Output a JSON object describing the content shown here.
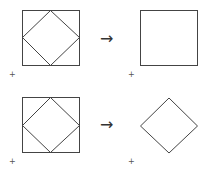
{
  "diagram": {
    "rows": [
      {
        "left": {
          "shape": "square-with-inscribed-diamond",
          "marker": "+"
        },
        "arrow": "→",
        "right": {
          "shape": "square",
          "marker": "+"
        }
      },
      {
        "left": {
          "shape": "square-with-inscribed-diamond",
          "marker": "+"
        },
        "arrow": "→",
        "right": {
          "shape": "diamond",
          "marker": "+"
        }
      }
    ],
    "stroke_color": "#444444"
  }
}
